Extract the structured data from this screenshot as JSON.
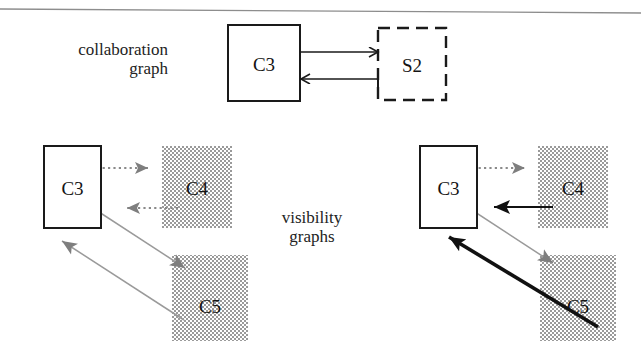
{
  "figure": {
    "title_rule": "top-horizontal-rule",
    "sections": [
      {
        "id": "collaboration",
        "caption_line1": "collaboration",
        "caption_line2": "graph",
        "nodes": [
          {
            "name": "C3",
            "label": "C3",
            "style": "solid-rect",
            "x": 228,
            "y": 25,
            "w": 72,
            "h": 76
          },
          {
            "name": "S2",
            "label": "S2",
            "style": "dashed-rect",
            "x": 378,
            "y": 28,
            "w": 68,
            "h": 72
          }
        ],
        "edges": [
          {
            "from": "C3",
            "to": "S2",
            "style": "solid-thin",
            "arrow": "open-v",
            "direction": "right"
          },
          {
            "from": "S2",
            "to": "C3",
            "style": "solid-thin",
            "arrow": "open-v",
            "direction": "left",
            "tail": "t-bar"
          }
        ]
      },
      {
        "id": "visibility-left",
        "caption_line1": "visibility",
        "caption_line2": "graphs",
        "nodes": [
          {
            "name": "C3",
            "label": "C3",
            "style": "solid-rect",
            "x": 44,
            "y": 146,
            "w": 57,
            "h": 82
          },
          {
            "name": "C4",
            "label": "C4",
            "style": "gray-dither-rect",
            "x": 162,
            "y": 146,
            "w": 70,
            "h": 82
          },
          {
            "name": "C5",
            "label": "C5",
            "style": "gray-dither-rect",
            "x": 172,
            "y": 255,
            "w": 76,
            "h": 86
          }
        ],
        "edges": [
          {
            "from": "C3",
            "to": "C4",
            "style": "dotted-gray",
            "arrow": "filled-gray",
            "direction": "right"
          },
          {
            "from": "C4",
            "to": "C3",
            "style": "dotted-gray",
            "arrow": "filled-gray",
            "direction": "left"
          },
          {
            "from": "C3",
            "to": "C5",
            "style": "thin-gray",
            "arrow": "filled-gray",
            "direction": "down-right"
          },
          {
            "from": "C5",
            "to": "C3",
            "style": "thin-gray",
            "arrow": "filled-gray",
            "direction": "up-left"
          }
        ]
      },
      {
        "id": "visibility-right",
        "nodes": [
          {
            "name": "C3",
            "label": "C3",
            "style": "solid-rect",
            "x": 420,
            "y": 146,
            "w": 57,
            "h": 82
          },
          {
            "name": "C4",
            "label": "C4",
            "style": "gray-dither-rect",
            "x": 538,
            "y": 146,
            "w": 70,
            "h": 82
          },
          {
            "name": "C5",
            "label": "C5",
            "style": "gray-dither-rect",
            "x": 540,
            "y": 255,
            "w": 76,
            "h": 86
          }
        ],
        "edges": [
          {
            "from": "C3",
            "to": "C4",
            "style": "dotted-gray",
            "arrow": "filled-gray",
            "direction": "right"
          },
          {
            "from": "C4",
            "to": "C3",
            "style": "solid-black-bold",
            "arrow": "filled-black",
            "direction": "left"
          },
          {
            "from": "C3",
            "to": "C5",
            "style": "thin-gray",
            "arrow": "filled-gray",
            "direction": "down-right"
          },
          {
            "from": "C5",
            "to": "C3",
            "style": "solid-black-bold",
            "arrow": "filled-black",
            "direction": "up-left"
          }
        ]
      }
    ],
    "colors": {
      "stroke_black": "#1a1a1a",
      "stroke_gray": "#7d7d7d",
      "fill_gray_node": "#b5b5b5",
      "background": "#ffffff",
      "rule": "#8a8a8a"
    }
  }
}
